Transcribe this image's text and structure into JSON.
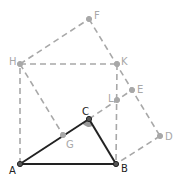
{
  "diagram": {
    "colors": {
      "solid": "#222222",
      "dashed": "#a8a8a8",
      "label_dark": "#222222",
      "label_gray": "#a8a8a8",
      "angle_fill": "#9a9a9a"
    },
    "points": {
      "A": {
        "x": 20,
        "y": 164,
        "label": "A",
        "lx": 9,
        "ly": 174,
        "dark": true
      },
      "B": {
        "x": 116,
        "y": 164,
        "label": "B",
        "lx": 121,
        "ly": 172,
        "dark": true
      },
      "C": {
        "x": 89,
        "y": 119,
        "label": "C",
        "lx": 82,
        "ly": 115,
        "dark": true
      },
      "D": {
        "x": 160,
        "y": 136,
        "label": "D",
        "lx": 165,
        "ly": 140,
        "dark": false
      },
      "E": {
        "x": 132,
        "y": 90,
        "label": "E",
        "lx": 137,
        "ly": 93,
        "dark": false
      },
      "F": {
        "x": 89,
        "y": 19,
        "label": "F",
        "lx": 94,
        "ly": 19,
        "dark": false
      },
      "G": {
        "x": 63,
        "y": 135,
        "label": "G",
        "lx": 66,
        "ly": 148,
        "dark": false
      },
      "H": {
        "x": 20,
        "y": 64,
        "label": "H",
        "lx": 9,
        "ly": 65,
        "dark": false
      },
      "K": {
        "x": 117,
        "y": 64,
        "label": "K",
        "lx": 121,
        "ly": 65,
        "dark": false
      },
      "L": {
        "x": 117,
        "y": 100,
        "label": "L",
        "lx": 108,
        "ly": 102,
        "dark": false
      }
    },
    "solid_segments": [
      [
        "A",
        "B"
      ],
      [
        "B",
        "C"
      ],
      [
        "C",
        "A"
      ]
    ],
    "dashed_segments": [
      [
        "A",
        "H"
      ],
      [
        "H",
        "K"
      ],
      [
        "K",
        "B"
      ],
      [
        "H",
        "F"
      ],
      [
        "F",
        "D"
      ],
      [
        "D",
        "B"
      ],
      [
        "H",
        "G"
      ],
      [
        "C",
        "E"
      ]
    ],
    "angle_mark": {
      "vertex": "C"
    }
  }
}
